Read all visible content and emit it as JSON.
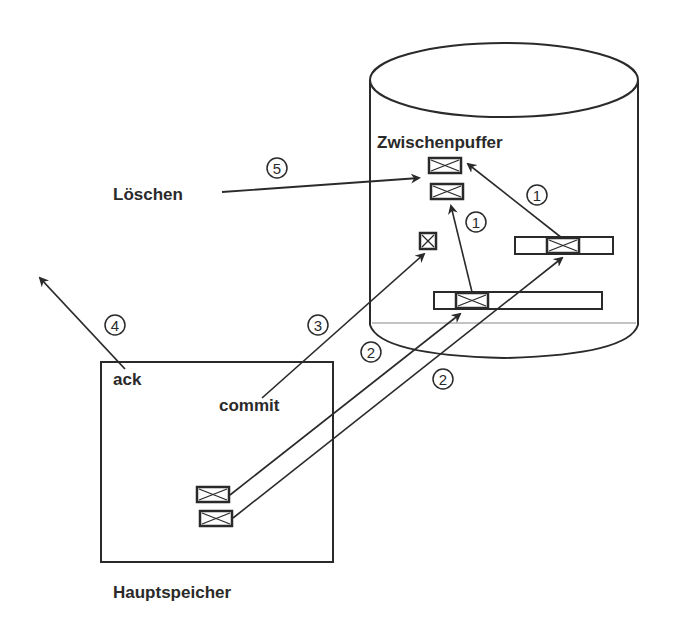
{
  "labels": {
    "buffer": "Zwischenpuffer",
    "delete": "Löschen",
    "ack": "ack",
    "commit": "commit",
    "memory": "Hauptspeicher"
  },
  "steps": {
    "s1a": "1",
    "s1b": "1",
    "s2a": "2",
    "s2b": "2",
    "s3": "3",
    "s4": "4",
    "s5": "5"
  },
  "colors": {
    "stroke": "#2a2a2a",
    "background": "#ffffff"
  }
}
